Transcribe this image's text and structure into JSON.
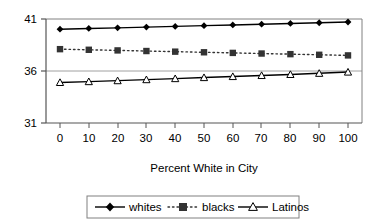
{
  "chart_data": {
    "type": "line",
    "title": "",
    "subtitle": "",
    "xlabel": "Percent White in City",
    "ylabel": "",
    "x": [
      0,
      10,
      20,
      30,
      40,
      50,
      60,
      70,
      80,
      90,
      100
    ],
    "xticklabels": [
      "0",
      "10",
      "20",
      "30",
      "40",
      "50",
      "60",
      "70",
      "80",
      "90",
      "100"
    ],
    "yticklabels": [
      "41",
      "36",
      "31"
    ],
    "yticks": [
      41,
      36,
      31
    ],
    "xlim": [
      -5,
      105
    ],
    "ylim": [
      31,
      41
    ],
    "grid": "horizontal-major-only",
    "legend_position": "below-outside",
    "series": [
      {
        "name": "whites",
        "marker": "filled-diamond",
        "linestyle": "solid",
        "color": "#000000",
        "values": [
          40.02,
          40.09,
          40.15,
          40.22,
          40.29,
          40.36,
          40.43,
          40.5,
          40.57,
          40.64,
          40.71
        ]
      },
      {
        "name": "blacks",
        "marker": "filled-square",
        "linestyle": "dotted",
        "color": "#333333",
        "values": [
          38.1,
          38.04,
          37.98,
          37.92,
          37.86,
          37.8,
          37.74,
          37.68,
          37.62,
          37.56,
          37.5
        ]
      },
      {
        "name": "Latinos",
        "marker": "open-triangle",
        "linestyle": "solid",
        "color": "#000000",
        "values": [
          34.9,
          34.98,
          35.07,
          35.17,
          35.27,
          35.37,
          35.47,
          35.57,
          35.67,
          35.78,
          35.9
        ]
      }
    ]
  },
  "axes": {
    "x_tick_labels": [
      "0",
      "10",
      "20",
      "30",
      "40",
      "50",
      "60",
      "70",
      "80",
      "90",
      "100"
    ],
    "y_tick_labels": [
      "41",
      "36",
      "31"
    ],
    "x_axis_title": "Percent White in City"
  },
  "legend": {
    "entries": [
      {
        "label": "whites",
        "marker": "filled-diamond",
        "linestyle": "solid"
      },
      {
        "label": "blacks",
        "marker": "filled-square",
        "linestyle": "dotted"
      },
      {
        "label": "Latinos",
        "marker": "open-triangle",
        "linestyle": "solid"
      }
    ]
  },
  "colors": {
    "plot_border": "#808080",
    "gridline": "#a0a0a0",
    "series_line": "#000000",
    "background": "#ffffff"
  }
}
